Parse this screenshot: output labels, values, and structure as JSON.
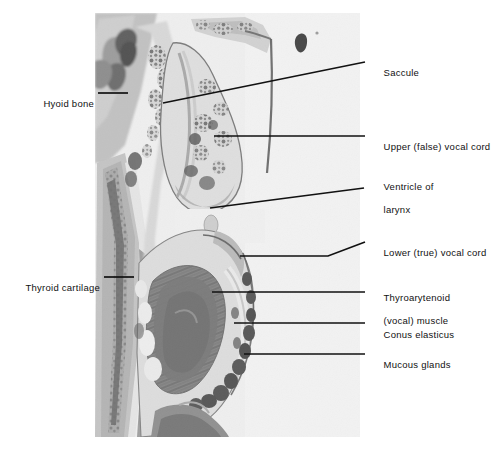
{
  "figure": {
    "kind": "histology-micrograph",
    "background_color": "#ffffff",
    "plate_color": "#f2f2f2",
    "leader_color": "#111111",
    "text_color": "#111111"
  },
  "labels": {
    "hyoid_bone": "Hyoid bone",
    "thyroid_cartilage": "Thyroid cartilage",
    "saccule": "Saccule",
    "upper_false_vocal_cord": "Upper (false) vocal cord",
    "ventricle_of_larynx_line1": "Ventricle of",
    "ventricle_of_larynx_line2": "larynx",
    "lower_true_vocal_cord": "Lower (true) vocal cord",
    "thyroarytenoid_line1": "Thyroarytenoid",
    "thyroarytenoid_line2": "(vocal) muscle",
    "conus_elasticus": "Conus elasticus",
    "mucous_glands": "Mucous glands"
  }
}
